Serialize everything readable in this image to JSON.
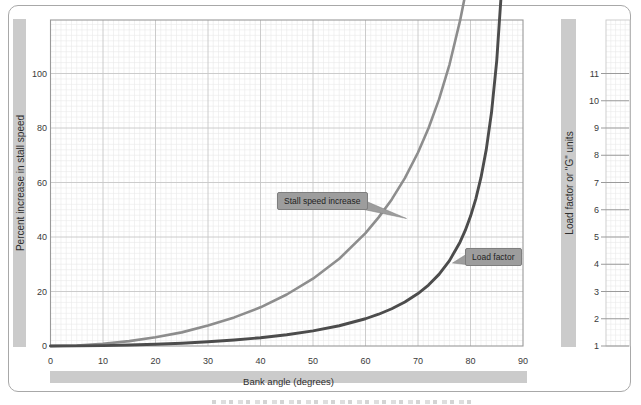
{
  "chart_data": {
    "type": "line",
    "title": "",
    "xlabel": "Bank angle (degrees)",
    "ylabel": "Percent increase in stall speed",
    "ylabel_right": "Load factor or \"G\" units",
    "x_range": [
      0,
      90
    ],
    "y_left_range": [
      0,
      119.6
    ],
    "y_right_range": [
      1,
      12.96
    ],
    "x_ticks": [
      0,
      10,
      20,
      30,
      40,
      50,
      60,
      70,
      80,
      90
    ],
    "y_left_ticks": [
      0,
      20,
      40,
      60,
      80,
      100
    ],
    "y_right_ticks": [
      1,
      2,
      3,
      4,
      5,
      6,
      7,
      8,
      9,
      10,
      11
    ],
    "grid": "graph-paper: minor every 1 deg / 2 pct, major every 10 deg / 20 pct",
    "legend_position": "callout-labels-on-plot",
    "x": [
      0,
      5,
      10,
      15,
      20,
      25,
      30,
      35,
      40,
      45,
      50,
      55,
      60,
      62.5,
      65,
      67.5,
      70,
      72,
      74,
      76,
      78,
      79,
      80,
      81,
      82,
      83,
      84,
      85,
      86,
      86.5,
      87
    ],
    "series": [
      {
        "name": "Stall speed increase",
        "axis": "left",
        "color": "#8d8d8d",
        "values": [
          0,
          0.2,
          0.8,
          1.8,
          3.2,
          5,
          7.5,
          10.5,
          14.2,
          18.9,
          24.7,
          32,
          41.4,
          47.2,
          53.8,
          61.6,
          71,
          79.9,
          90.5,
          103.3,
          119.3,
          128.9,
          140,
          152.8,
          168.1,
          186.5,
          209.3,
          238.7,
          278.6,
          304.7,
          337.1
        ]
      },
      {
        "name": "Load factor",
        "axis": "right",
        "color": "#4c4c4c",
        "values": [
          1,
          1.004,
          1.015,
          1.035,
          1.064,
          1.103,
          1.155,
          1.221,
          1.305,
          1.414,
          1.556,
          1.743,
          2,
          2.166,
          2.366,
          2.613,
          2.924,
          3.236,
          3.628,
          4.134,
          4.81,
          5.241,
          5.759,
          6.392,
          7.185,
          8.206,
          9.567,
          11.474,
          14.336,
          16.38,
          19.107
        ]
      }
    ],
    "annotations": [
      {
        "text": "Stall speed increase",
        "points_to": "gray curve, left axis"
      },
      {
        "text": "Load factor",
        "points_to": "dark curve, right axis"
      }
    ]
  },
  "colors": {
    "band": "#cbcbcb",
    "grid_minor": "#e9e9e9",
    "grid_major": "#c6c6c6",
    "plot_border": "#9a9a9a",
    "strip_border": "#c9c9c9",
    "tick_text": "#3a3a3a",
    "callout_fill": "#9d9d9d",
    "callout_border": "#7e7e7e",
    "card_border": "#a8a8a8"
  }
}
